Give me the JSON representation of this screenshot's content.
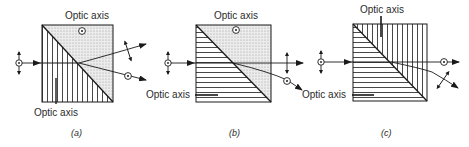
{
  "figure": {
    "panels": [
      {
        "id": "a",
        "caption": "(a)",
        "top_label": "Optic axis",
        "bottom_label": "Optic axis",
        "left_prism_hatch": "vertical",
        "right_prism_hatch": "dotted-out-of-plane",
        "output_beams": [
          "deflected-up (in-plane polarization)",
          "deflected-down (out-of-plane polarization)"
        ]
      },
      {
        "id": "b",
        "caption": "(b)",
        "top_label": "Optic axis",
        "side_label": "Optic axis",
        "left_prism_hatch": "horizontal",
        "right_prism_hatch": "dotted-out-of-plane",
        "output_beams": [
          "undeviated (in-plane polarization)",
          "deflected-down (out-of-plane polarization)"
        ]
      },
      {
        "id": "c",
        "caption": "(c)",
        "top_label": "Optic axis",
        "side_label": "Optic axis",
        "left_prism_hatch": "horizontal",
        "right_prism_hatch": "vertical",
        "output_beams": [
          "undeviated (out-of-plane polarization)",
          "deflected-down (in-plane polarization)"
        ]
      }
    ],
    "colors": {
      "line": "#1a1a1a",
      "stipple": "#d9d9d9",
      "background": "#ffffff"
    }
  }
}
